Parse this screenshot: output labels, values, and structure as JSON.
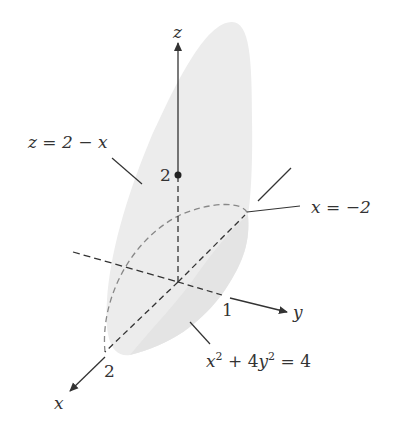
{
  "axes": {
    "z_label": "z",
    "x_label": "x",
    "y_label": "y"
  },
  "ticks": {
    "z_tick": "2",
    "x_tick": "2",
    "y_tick": "1"
  },
  "annotations": {
    "plane": "z = 2 − x",
    "plane_bottom": "x = −2",
    "cylinder_x2": "x",
    "cylinder_plus": " + 4",
    "cylinder_y2": "y",
    "cylinder_eq": " = 4",
    "sup": "2"
  },
  "colors": {
    "surface": "#ececec",
    "surface_dark": "#e2e2e2",
    "line": "#333333",
    "dashed_curve": "#888888"
  }
}
